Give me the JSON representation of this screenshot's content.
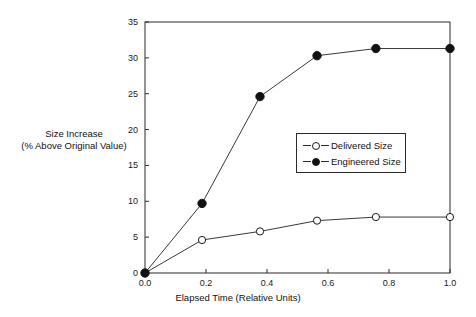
{
  "chart_data": {
    "type": "line",
    "title": "",
    "xlabel": "Elapsed Time (Relative Units)",
    "ylabel_line1": "Size Increase",
    "ylabel_line2": "(% Above Original Value)",
    "xlim": [
      0.0,
      1.0
    ],
    "ylim": [
      0,
      35
    ],
    "xticks": [
      "0.0",
      "0.2",
      "0.4",
      "0.6",
      "0.8",
      "1.0"
    ],
    "xtick_values": [
      0.0,
      0.2,
      0.4,
      0.6,
      0.8,
      1.0
    ],
    "yticks": [
      "0",
      "5",
      "10",
      "15",
      "20",
      "25",
      "30",
      "35"
    ],
    "ytick_values": [
      0,
      5,
      10,
      15,
      20,
      25,
      30,
      35
    ],
    "grid": false,
    "legend_position": "center-right-inside",
    "x": [
      0.0,
      0.187,
      0.377,
      0.564,
      0.757,
      1.0
    ],
    "series": [
      {
        "name": "Delivered Size",
        "marker": "open-circle",
        "color": "#1a1a1a",
        "values": [
          0.0,
          4.6,
          5.8,
          7.3,
          7.8,
          7.8
        ]
      },
      {
        "name": "Engineered Size",
        "marker": "filled-circle",
        "color": "#111111",
        "values": [
          0.0,
          9.7,
          24.6,
          30.3,
          31.3,
          31.3
        ]
      }
    ]
  },
  "legend": {
    "items": [
      {
        "label": "Delivered Size",
        "marker": "open-circle"
      },
      {
        "label": "Engineered Size",
        "marker": "filled-circle"
      }
    ]
  },
  "colors": {
    "axis": "#2b2b2b",
    "line": "#3a3a3a",
    "marker_fill": "#111111",
    "marker_open": "#ffffff",
    "background": "#ffffff"
  }
}
